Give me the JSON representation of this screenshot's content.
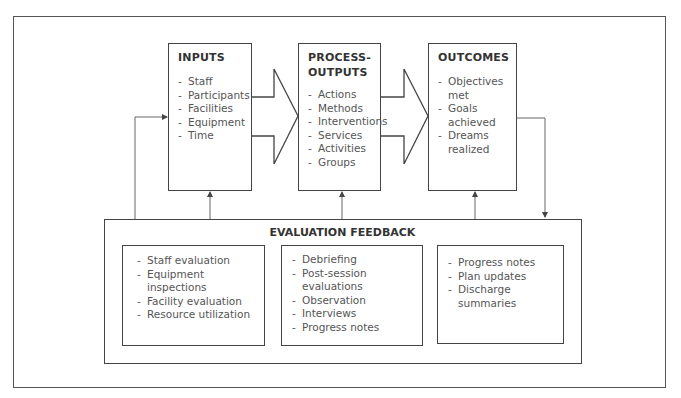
{
  "diagram": {
    "stages": [
      {
        "title": "INPUTS",
        "items": [
          "Staff",
          "Participants",
          "Facilities",
          "Equipment",
          "Time"
        ]
      },
      {
        "title_line1": "PROCESS-",
        "title_line2": "OUTPUTS",
        "items": [
          "Actions",
          "Methods",
          "Interventions",
          "Services",
          "Activities",
          "Groups"
        ]
      },
      {
        "title": "OUTCOMES",
        "items": [
          "Objectives met",
          "Goals achieved",
          "Dreams realized"
        ]
      }
    ],
    "feedback": {
      "title": "EVALUATION FEEDBACK",
      "groups": [
        {
          "items": [
            "Staff evaluation",
            "Equipment inspections",
            "Facility evaluation",
            "Resource utilization"
          ]
        },
        {
          "items": [
            "Debriefing",
            "Post-session evaluations",
            "Observation",
            "Interviews",
            "Progress notes"
          ]
        },
        {
          "items": [
            "Progress notes",
            "Plan updates",
            "Discharge summaries"
          ]
        }
      ]
    },
    "colors": {
      "line": "#555555",
      "title_text": "#333333",
      "item_text": "#555555"
    }
  }
}
